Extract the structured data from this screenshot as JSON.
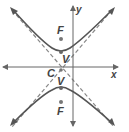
{
  "figure": {
    "type": "vertical-hyperbola",
    "axes": {
      "x_label": "x",
      "y_label": "y"
    },
    "points": {
      "focus_upper": {
        "label": "F"
      },
      "vertex_upper": {
        "label": "V"
      },
      "center": {
        "label": "C"
      },
      "vertex_lower": {
        "label": "V"
      },
      "focus_lower": {
        "label": "F"
      }
    },
    "colors": {
      "curve": "#555555",
      "asymptote": "#888888",
      "axis": "#666666",
      "point": "#777777"
    }
  }
}
